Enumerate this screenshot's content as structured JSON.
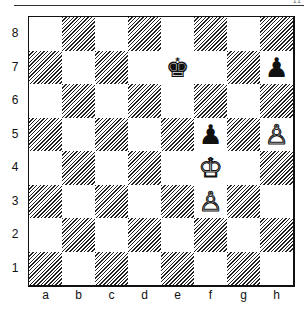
{
  "page": {
    "corner_mark": "11"
  },
  "board": {
    "files": [
      "a",
      "b",
      "c",
      "d",
      "e",
      "f",
      "g",
      "h"
    ],
    "ranks": [
      "8",
      "7",
      "6",
      "5",
      "4",
      "3",
      "2",
      "1"
    ],
    "dark_square_style": "diagonal-hatch",
    "pieces": [
      {
        "square": "e7",
        "color": "black",
        "type": "king",
        "glyph": "♚"
      },
      {
        "square": "h7",
        "color": "black",
        "type": "pawn",
        "glyph": "♟"
      },
      {
        "square": "f5",
        "color": "black",
        "type": "pawn",
        "glyph": "♟"
      },
      {
        "square": "h5",
        "color": "white",
        "type": "pawn",
        "glyph": "♙"
      },
      {
        "square": "f4",
        "color": "white",
        "type": "king",
        "glyph": "♔"
      },
      {
        "square": "f3",
        "color": "white",
        "type": "pawn",
        "glyph": "♙"
      }
    ]
  },
  "colors": {
    "ink": "#111111",
    "paper": "#ffffff"
  }
}
